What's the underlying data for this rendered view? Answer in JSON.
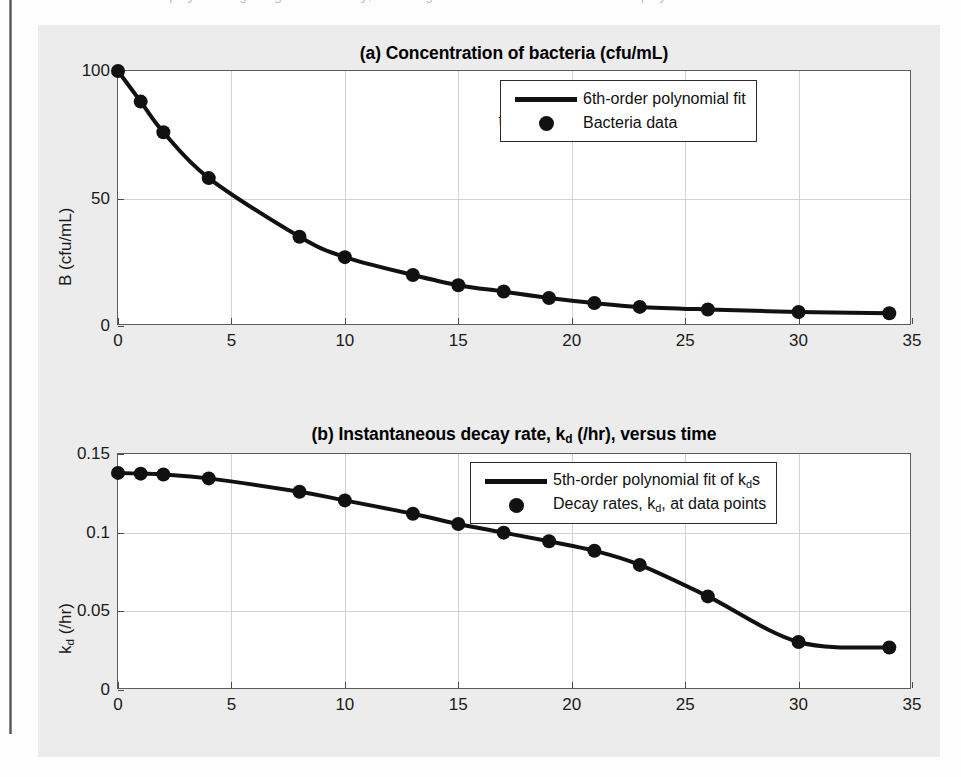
{
  "document": {
    "cut_top_line": "methods were employed using the given data only; the fitting results are shown below for both polynomial fits."
  },
  "figure": {
    "background_color": "#ececec",
    "axes_color": "#ffffff",
    "line_color": "#111111",
    "marker_color": "#111111",
    "grid_color": "#d2d2d2"
  },
  "chart_data": [
    {
      "id": "a",
      "type": "scatter",
      "title": "(a) Concentration of bacteria (cfu/mL)",
      "xlabel": "t(hr)",
      "ylabel": "B (cfu/mL)",
      "xlim": [
        0,
        35
      ],
      "ylim": [
        0,
        100
      ],
      "xticks": [
        0,
        5,
        10,
        15,
        20,
        25,
        30,
        35
      ],
      "yticks": [
        0,
        50,
        100
      ],
      "grid": true,
      "legend_position": "north-east",
      "series": [
        {
          "name": "6th-order polynomial fit",
          "kind": "line",
          "x": [
            0,
            1,
            2,
            4,
            8,
            10,
            13,
            15,
            17,
            19,
            21,
            23,
            26,
            30,
            34
          ],
          "values": [
            100,
            88,
            76,
            58,
            35,
            27,
            20,
            16,
            13.5,
            11,
            9,
            7.5,
            6.5,
            5.5,
            5
          ]
        },
        {
          "name": "Bacteria data",
          "kind": "markers",
          "x": [
            0,
            1,
            2,
            4,
            8,
            10,
            13,
            15,
            17,
            19,
            21,
            23,
            26,
            30,
            34
          ],
          "values": [
            100,
            88,
            76,
            58,
            35,
            27,
            20,
            16,
            13.5,
            11,
            9,
            7.5,
            6.5,
            5.5,
            5
          ]
        }
      ]
    },
    {
      "id": "b",
      "type": "scatter",
      "title": "(b) Instantaneous decay rate, k_d (/hr), versus time",
      "title_parts": [
        "(b) Instantaneous decay rate, k",
        "d",
        " (/hr), versus time"
      ],
      "xlabel": "t(hr)",
      "ylabel": "k_d (/hr)",
      "ylabel_parts": [
        "k",
        "d",
        " (/hr)"
      ],
      "xlim": [
        0,
        35
      ],
      "ylim": [
        0,
        0.15
      ],
      "xticks": [
        0,
        5,
        10,
        15,
        20,
        25,
        30,
        35
      ],
      "yticks": [
        0,
        0.05,
        0.1,
        0.15
      ],
      "ytick_labels": [
        "0",
        "0.05",
        "0.1",
        "0.15"
      ],
      "grid": true,
      "legend_position": "north-east",
      "series": [
        {
          "name": "5th-order polynomial fit of k_d s",
          "name_parts": [
            "5th-order polynomial fit of k",
            "d",
            "s"
          ],
          "kind": "line",
          "x": [
            0,
            1,
            2,
            4,
            8,
            10,
            13,
            15,
            17,
            19,
            21,
            23,
            26,
            30,
            34
          ],
          "values": [
            0.138,
            0.1375,
            0.137,
            0.1345,
            0.126,
            0.1205,
            0.112,
            0.1055,
            0.1,
            0.0945,
            0.0885,
            0.0795,
            0.0595,
            0.0305,
            0.027
          ]
        },
        {
          "name": "Decay rates, k_d, at data points",
          "name_parts": [
            "Decay rates, k",
            "d",
            ", at data points"
          ],
          "kind": "markers",
          "x": [
            0,
            1,
            2,
            4,
            8,
            10,
            13,
            15,
            17,
            19,
            21,
            23,
            26,
            30,
            34
          ],
          "values": [
            0.138,
            0.1375,
            0.137,
            0.1345,
            0.126,
            0.1205,
            0.112,
            0.1055,
            0.1,
            0.0945,
            0.0885,
            0.0795,
            0.0595,
            0.0305,
            0.027
          ]
        }
      ]
    }
  ]
}
